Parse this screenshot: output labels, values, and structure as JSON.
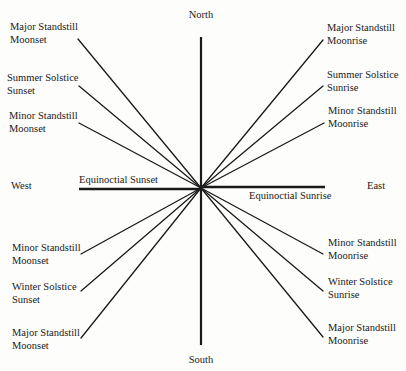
{
  "diagram": {
    "center": {
      "x": 201,
      "y": 188
    },
    "directions": {
      "north": {
        "text": "North",
        "x": 201,
        "y": 18
      },
      "south": {
        "text": "South",
        "x": 201,
        "y": 363
      },
      "west": {
        "text": "West",
        "x": 11,
        "y": 189
      },
      "east": {
        "text": "East",
        "x": 367,
        "y": 189
      }
    },
    "axis_vertical": {
      "x": 201,
      "y1": 37,
      "y2": 345
    },
    "equinox": {
      "sunset": {
        "text": "Equinoctial Sunset",
        "x1": 79,
        "y1": 189,
        "x2": 201,
        "y2": 189,
        "label_x": 79,
        "label_y": 183
      },
      "sunrise": {
        "text": "Equinoctial Sunrise",
        "x1": 201,
        "y1": 187,
        "x2": 325,
        "y2": 187,
        "label_x": 249,
        "label_y": 199
      }
    },
    "rays": [
      {
        "id": "major-standstill-moonset-north",
        "end_x": 78,
        "end_y": 39,
        "line1": "Major Standstill",
        "line2": "Moonset",
        "label_x": 10,
        "label_y": 30,
        "anchor": "start"
      },
      {
        "id": "summer-solstice-sunset",
        "end_x": 79,
        "end_y": 86,
        "line1": "Summer Solstice",
        "line2": "Sunset",
        "label_x": 7,
        "label_y": 81,
        "anchor": "start"
      },
      {
        "id": "minor-standstill-moonset-north",
        "end_x": 79,
        "end_y": 123,
        "line1": "Minor Standstill",
        "line2": "Moonset",
        "label_x": 9,
        "label_y": 119,
        "anchor": "start"
      },
      {
        "id": "major-standstill-moonrise-north",
        "end_x": 323,
        "end_y": 40,
        "line1": "Major Standstill",
        "line2": "Moonrise",
        "label_x": 327,
        "label_y": 31,
        "anchor": "start"
      },
      {
        "id": "summer-solstice-sunrise",
        "end_x": 323,
        "end_y": 86,
        "line1": "Summer Solstice",
        "line2": "Sunrise",
        "label_x": 327,
        "label_y": 78,
        "anchor": "start"
      },
      {
        "id": "minor-standstill-moonrise-north",
        "end_x": 324,
        "end_y": 123,
        "line1": "Minor Standstill",
        "line2": "Moonrise",
        "label_x": 328,
        "label_y": 114,
        "anchor": "start"
      },
      {
        "id": "minor-standstill-moonset-south",
        "end_x": 81,
        "end_y": 254,
        "line1": "Minor Standstill",
        "line2": "Moonset",
        "label_x": 12,
        "label_y": 251,
        "anchor": "start"
      },
      {
        "id": "winter-solstice-sunset",
        "end_x": 81,
        "end_y": 291,
        "line1": "Winter Solstice",
        "line2": "Sunset",
        "label_x": 12,
        "label_y": 290,
        "anchor": "start"
      },
      {
        "id": "major-standstill-moonset-south",
        "end_x": 81,
        "end_y": 338,
        "line1": "Major Standstill",
        "line2": "Moonset",
        "label_x": 12,
        "label_y": 336,
        "anchor": "start"
      },
      {
        "id": "minor-standstill-moonrise-south",
        "end_x": 323,
        "end_y": 254,
        "line1": "Minor Standstill",
        "line2": "Moonrise",
        "label_x": 328,
        "label_y": 246,
        "anchor": "start"
      },
      {
        "id": "winter-solstice-sunrise",
        "end_x": 323,
        "end_y": 291,
        "line1": "Winter Solstice",
        "line2": "Sunrise",
        "label_x": 328,
        "label_y": 285,
        "anchor": "start"
      },
      {
        "id": "major-standstill-moonrise-south",
        "end_x": 323,
        "end_y": 337,
        "line1": "Major Standstill",
        "line2": "Moonrise",
        "label_x": 328,
        "label_y": 331,
        "anchor": "start"
      }
    ],
    "colors": {
      "ink": "#1a1a1a",
      "paper": "#fdfdfb"
    }
  }
}
